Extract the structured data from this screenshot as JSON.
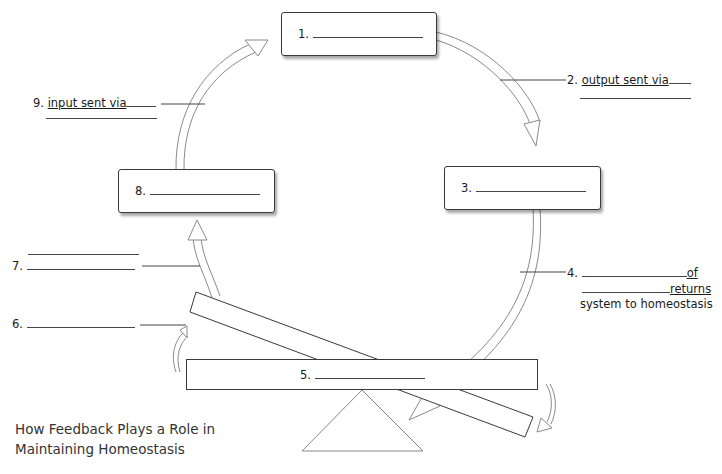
{
  "caption": {
    "line1": "How Feedback Plays a Role in",
    "line2": "Maintaining Homeostasis"
  },
  "boxes": {
    "b1": {
      "number": "1."
    },
    "b3": {
      "number": "3."
    },
    "b8": {
      "number": "8."
    },
    "b5": {
      "number": "5."
    }
  },
  "labels": {
    "l2": {
      "number": "2.",
      "text": "output sent via"
    },
    "l4": {
      "number": "4.",
      "word1": "of",
      "word2": "returns",
      "line3": "system to homeostasis"
    },
    "l6": {
      "number": "6."
    },
    "l7": {
      "number": "7."
    },
    "l9": {
      "number": "9.",
      "text": "input sent via"
    }
  },
  "colors": {
    "stroke": "#3a3a3a",
    "arrow": "#888888"
  }
}
